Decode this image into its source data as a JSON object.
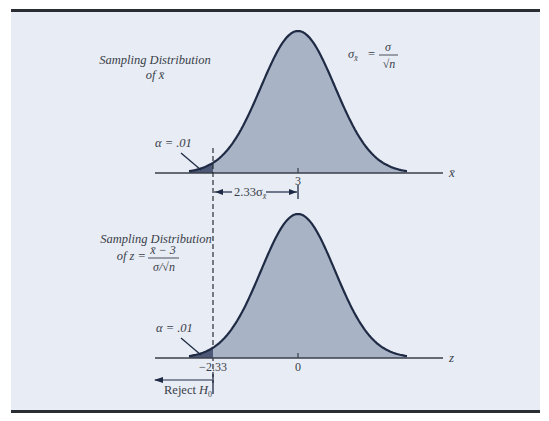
{
  "figure": {
    "background": "#e8ecf4",
    "frame_bar_color": "#2a2d33",
    "curve_fill": "#a9b3c6",
    "tail_fill": "#4c5876",
    "curve_stroke": "#1f2a44",
    "axis_color": "#3a3f4a"
  },
  "top_panel": {
    "title_line1": "Sampling Distribution",
    "title_line2_prefix": "of ",
    "title_line2_var": "x̄",
    "formula_lhs": "σ",
    "formula_lhs_sub": "x̄",
    "formula_eq": "=",
    "formula_num": "σ",
    "formula_den": "√n",
    "alpha_label": "α = .01",
    "axis_label": "x̄",
    "tick_label": "3",
    "distance_label": "2.33σ",
    "distance_sub": "x̄"
  },
  "bottom_panel": {
    "title_line1": "Sampling Distribution",
    "title_line2_prefix": "of z =",
    "formula_num": "x̄ − 3",
    "formula_den": "σ/√n",
    "alpha_label": "α = .01",
    "axis_label": "z",
    "tick_critical": "−2.33",
    "tick_center": "0",
    "reject_label": "Reject ",
    "reject_var": "H",
    "reject_sub": "0"
  }
}
